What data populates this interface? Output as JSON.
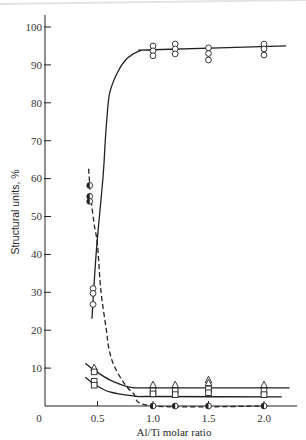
{
  "figure": {
    "xlabel": "Al/Ti molar ratio",
    "ylabel": "Structural units, %",
    "origin_label": "0"
  },
  "chart_data": {
    "type": "scatter",
    "title": "",
    "xlabel": "Al/Ti molar ratio",
    "ylabel": "Structural units, %",
    "xlim": [
      0,
      2.25
    ],
    "ylim": [
      0,
      103
    ],
    "grid": false,
    "legend": null,
    "origin_label": "0",
    "xticks": [
      {
        "value": 0.5,
        "label": "0.5"
      },
      {
        "value": 1.0,
        "label": "1.0"
      },
      {
        "value": 1.5,
        "label": "1.5"
      },
      {
        "value": 2.0,
        "label": "2.0"
      }
    ],
    "yticks": [
      {
        "value": 10,
        "label": "10"
      },
      {
        "value": 20,
        "label": "20"
      },
      {
        "value": 30,
        "label": "30"
      },
      {
        "value": 40,
        "label": "40"
      },
      {
        "value": 50,
        "label": "50"
      },
      {
        "value": 60,
        "label": "60"
      },
      {
        "value": 70,
        "label": "70"
      },
      {
        "value": 80,
        "label": "80"
      },
      {
        "value": 90,
        "label": "90"
      },
      {
        "value": 100,
        "label": "100"
      }
    ],
    "series": [
      {
        "name": "open circles",
        "marker": "circle-open",
        "line_style": "solid",
        "points": [
          [
            0.46,
            31
          ],
          [
            0.46,
            29.7
          ],
          [
            0.46,
            26.8
          ],
          [
            1.0,
            95
          ],
          [
            1.0,
            93.7
          ],
          [
            1.0,
            92.4
          ],
          [
            1.2,
            95.5
          ],
          [
            1.2,
            94.2
          ],
          [
            1.2,
            92.9
          ],
          [
            1.5,
            94.5
          ],
          [
            1.5,
            93
          ],
          [
            1.5,
            91.3
          ],
          [
            2.0,
            95.5
          ],
          [
            2.0,
            94.2
          ],
          [
            2.0,
            92.6
          ]
        ],
        "fit_curve": [
          [
            0.45,
            23
          ],
          [
            0.49,
            41
          ],
          [
            0.55,
            60.5
          ],
          [
            0.57,
            70
          ],
          [
            0.585,
            76
          ],
          [
            0.61,
            82.6
          ],
          [
            0.68,
            88
          ],
          [
            0.77,
            91.8
          ],
          [
            0.88,
            93.7
          ],
          [
            1.0,
            94
          ],
          [
            2.2,
            95
          ]
        ]
      },
      {
        "name": "half-filled circles",
        "marker": "circle-half",
        "line_style": "dashed",
        "points": [
          [
            0.43,
            58.2
          ],
          [
            0.43,
            55.3
          ],
          [
            0.43,
            54
          ],
          [
            1.0,
            0
          ],
          [
            1.2,
            0
          ],
          [
            1.5,
            0
          ],
          [
            2.0,
            0
          ]
        ],
        "fit_curve": [
          [
            0.42,
            62.6
          ],
          [
            0.44,
            55
          ],
          [
            0.47,
            48
          ],
          [
            0.5,
            42.5
          ],
          [
            0.53,
            30.6
          ],
          [
            0.58,
            20
          ],
          [
            0.6,
            15.6
          ],
          [
            0.64,
            11.3
          ],
          [
            0.72,
            6.9
          ],
          [
            0.82,
            3.4
          ],
          [
            1.0,
            0
          ],
          [
            2.05,
            0
          ]
        ]
      },
      {
        "name": "triangles",
        "marker": "triangle-open",
        "line_style": "solid",
        "points": [
          [
            0.47,
            10
          ],
          [
            1.0,
            5.5
          ],
          [
            1.2,
            5.5
          ],
          [
            1.5,
            6.8
          ],
          [
            1.5,
            6
          ],
          [
            2.0,
            5.5
          ]
        ],
        "fit_curve": [
          [
            0.39,
            11.3
          ],
          [
            0.47,
            9.5
          ],
          [
            0.61,
            6.9
          ],
          [
            0.79,
            5
          ],
          [
            1.0,
            4.8
          ],
          [
            2.23,
            4.8
          ]
        ]
      },
      {
        "name": "squares",
        "marker": "square-open",
        "line_style": "solid",
        "points": [
          [
            0.47,
            9
          ],
          [
            0.47,
            6.5
          ],
          [
            0.47,
            5.5
          ],
          [
            1.0,
            4
          ],
          [
            1.0,
            3.2
          ],
          [
            1.2,
            4
          ],
          [
            1.2,
            3
          ],
          [
            1.5,
            4.5
          ],
          [
            1.5,
            3.5
          ],
          [
            2.0,
            4
          ],
          [
            2.0,
            3
          ]
        ],
        "fit_curve": [
          [
            0.39,
            7.6
          ],
          [
            0.47,
            5.8
          ],
          [
            0.61,
            3.7
          ],
          [
            0.84,
            2.6
          ],
          [
            1.0,
            2.5
          ],
          [
            2.16,
            2.4
          ]
        ]
      }
    ]
  }
}
